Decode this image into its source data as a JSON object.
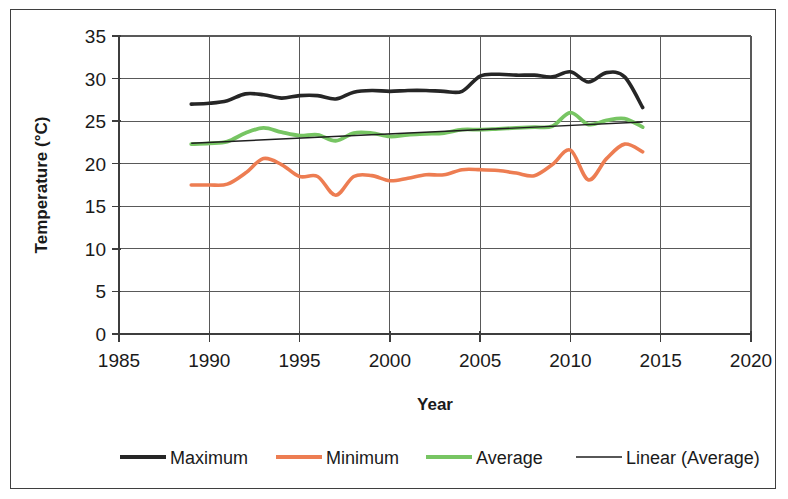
{
  "chart_data": {
    "type": "line",
    "title": "",
    "xlabel": "Year",
    "ylabel": "Temperature (°C)",
    "xlim": [
      1985,
      2020
    ],
    "ylim": [
      0,
      35
    ],
    "xticks": [
      1985,
      1990,
      1995,
      2000,
      2005,
      2010,
      2015,
      2020
    ],
    "yticks": [
      0,
      5,
      10,
      15,
      20,
      25,
      30,
      35
    ],
    "grid": "horizontal-and-vertical",
    "legend_position": "bottom",
    "x": [
      1989,
      1990,
      1991,
      1992,
      1993,
      1994,
      1995,
      1996,
      1997,
      1998,
      1999,
      2000,
      2001,
      2002,
      2003,
      2004,
      2005,
      2006,
      2007,
      2008,
      2009,
      2010,
      2011,
      2012,
      2013,
      2014
    ],
    "series": [
      {
        "name": "Maximum",
        "color": "#262626",
        "width": 3.6,
        "values": [
          27.0,
          27.1,
          27.4,
          28.2,
          28.1,
          27.7,
          28.0,
          28.0,
          27.6,
          28.4,
          28.6,
          28.5,
          28.6,
          28.6,
          28.5,
          28.5,
          30.3,
          30.5,
          30.4,
          30.4,
          30.2,
          30.8,
          29.6,
          30.7,
          30.2,
          26.6
        ]
      },
      {
        "name": "Minimum",
        "color": "#ed7d52",
        "width": 3.6,
        "values": [
          17.5,
          17.5,
          17.6,
          18.9,
          20.6,
          19.9,
          18.5,
          18.5,
          16.3,
          18.5,
          18.6,
          18.0,
          18.3,
          18.7,
          18.7,
          19.3,
          19.3,
          19.2,
          18.9,
          18.6,
          19.9,
          21.6,
          18.1,
          20.6,
          22.3,
          21.4
        ]
      },
      {
        "name": "Average",
        "color": "#77c563",
        "width": 3.8,
        "values": [
          22.3,
          22.4,
          22.6,
          23.6,
          24.2,
          23.7,
          23.3,
          23.4,
          22.7,
          23.6,
          23.6,
          23.2,
          23.4,
          23.5,
          23.6,
          24.0,
          24.0,
          24.1,
          24.2,
          24.3,
          24.4,
          26.0,
          24.6,
          25.1,
          25.3,
          24.3
        ]
      }
    ],
    "trendline": {
      "name": "Linear (Average)",
      "color": "#1f1f1f",
      "width": 1.4,
      "x": [
        1989,
        2014
      ],
      "values": [
        22.4,
        24.9
      ]
    },
    "legend": [
      {
        "label": "Maximum",
        "color": "#262626",
        "width": 4.2
      },
      {
        "label": "Minimum",
        "color": "#ed7d52",
        "width": 4.2
      },
      {
        "label": "Average",
        "color": "#77c563",
        "width": 4.2
      },
      {
        "label": "Linear (Average)",
        "color": "#1f1f1f",
        "width": 1.6
      }
    ]
  }
}
